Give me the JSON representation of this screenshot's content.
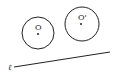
{
  "diagram": {
    "circles": [
      {
        "name": "O",
        "label": "O",
        "cx": 38,
        "cy": 33,
        "r": 16
      },
      {
        "name": "O-prime",
        "label": "O'",
        "cx": 82,
        "cy": 24,
        "r": 17
      }
    ],
    "line": {
      "label": "ℓ",
      "x1": 14,
      "y1": 67,
      "x2": 110,
      "y2": 52
    },
    "stroke_color": "#222222"
  }
}
